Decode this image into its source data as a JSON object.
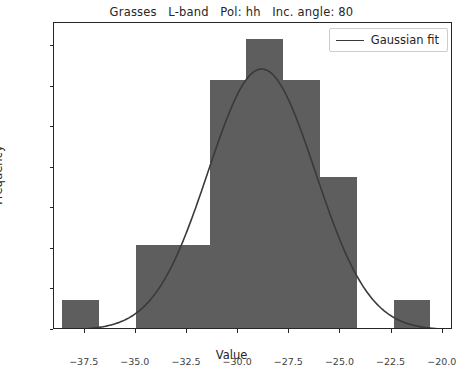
{
  "chart_data": {
    "type": "bar",
    "title": "Grasses   L-band   Pol: hh   Inc. angle: 80",
    "xlabel": "Value",
    "ylabel": "Frequency",
    "xlim": [
      -39.0,
      -19.5
    ],
    "ylim": [
      0.0,
      0.1515
    ],
    "xticks": [
      -37.5,
      -35.0,
      -32.5,
      -30.0,
      -27.5,
      -25.0,
      -22.5,
      -20.0
    ],
    "xtick_labels": [
      "−37.5",
      "−35.0",
      "−32.5",
      "−30.0",
      "−27.5",
      "−25.0",
      "−22.5",
      "−20.0"
    ],
    "yticks": [
      0.0,
      0.02,
      0.04,
      0.06,
      0.08,
      0.1,
      0.12,
      0.14
    ],
    "ytick_labels": [
      "0.00",
      "0.02",
      "0.04",
      "0.06",
      "0.08",
      "0.10",
      "0.12",
      "0.14"
    ],
    "grid": false,
    "bar_color": "#5e5e5e",
    "line_color": "#3a3a3a",
    "bin_edges": [
      -38.6,
      -36.8,
      -35.0,
      -33.2,
      -31.4,
      -29.6,
      -27.8,
      -26.0,
      -24.2,
      -22.4,
      -20.6
    ],
    "bin_centers": [
      -37.7,
      -35.9,
      -34.1,
      -32.3,
      -30.5,
      -28.7,
      -26.9,
      -25.1,
      -23.3,
      -21.5
    ],
    "values": [
      0.0136,
      0.0,
      0.0408,
      0.0408,
      0.1223,
      0.1427,
      0.1223,
      0.0745,
      0.0,
      0.0136
    ],
    "legend": {
      "position": "upper right",
      "entries": [
        {
          "label": "Gaussian fit",
          "type": "line"
        }
      ]
    },
    "gaussian_fit": {
      "amplitude": 0.1288,
      "mean": -28.85,
      "sigma": 2.62
    }
  },
  "title": "Grasses   L-band   Pol: hh   Inc. angle: 80",
  "legend_label": "Gaussian fit"
}
